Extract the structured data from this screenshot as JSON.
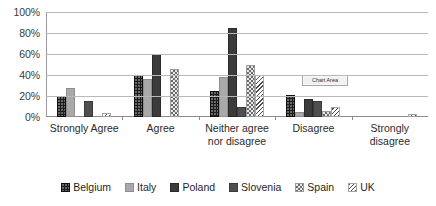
{
  "chart_data": {
    "type": "bar",
    "title": "",
    "xlabel": "",
    "ylabel": "",
    "ylim": [
      0,
      100
    ],
    "grid": true,
    "legend_position": "bottom",
    "categories": [
      "Strongly Agree",
      "Agree",
      "Neither agree nor disagree",
      "Disagree",
      "Strongly disagree"
    ],
    "category_lines": [
      [
        "Strongly Agree"
      ],
      [
        "Agree"
      ],
      [
        "Neither agree",
        "nor disagree"
      ],
      [
        "Disagree"
      ],
      [
        "Strongly",
        "disagree"
      ]
    ],
    "ytick_labels": [
      "100%",
      "80%",
      "60%",
      "40%",
      "20%",
      "0%"
    ],
    "ytick_values": [
      100,
      80,
      60,
      40,
      20,
      0
    ],
    "series": [
      {
        "name": "Belgium",
        "pattern": "dark-dotted",
        "values": [
          20,
          40,
          25,
          21,
          0
        ]
      },
      {
        "name": "Italy",
        "pattern": "light-gray",
        "values": [
          28,
          36,
          38,
          5,
          0
        ]
      },
      {
        "name": "Poland",
        "pattern": "dark-gray",
        "values": [
          0,
          60,
          85,
          17,
          0
        ]
      },
      {
        "name": "Slovenia",
        "pattern": "medium-dark",
        "values": [
          15,
          0,
          10,
          15,
          0
        ]
      },
      {
        "name": "Spain",
        "pattern": "checkered",
        "values": [
          0,
          46,
          50,
          6,
          0
        ]
      },
      {
        "name": "UK",
        "pattern": "diagonal-hatch",
        "values": [
          4,
          0,
          40,
          10,
          3
        ]
      }
    ]
  },
  "annotations": {
    "chart_area_tooltip": "Chart Area"
  }
}
